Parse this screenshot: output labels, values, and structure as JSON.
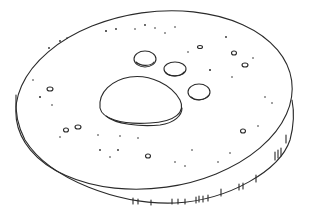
{
  "image": {
    "subject": "Line drawing of a round disc cast with an animal paw print",
    "background": "#ffffff",
    "stroke": "#2a2a2a",
    "elements": [
      "disc-top",
      "disc-side",
      "paw-pad",
      "toe-1",
      "toe-2",
      "toe-3",
      "speckles"
    ]
  }
}
